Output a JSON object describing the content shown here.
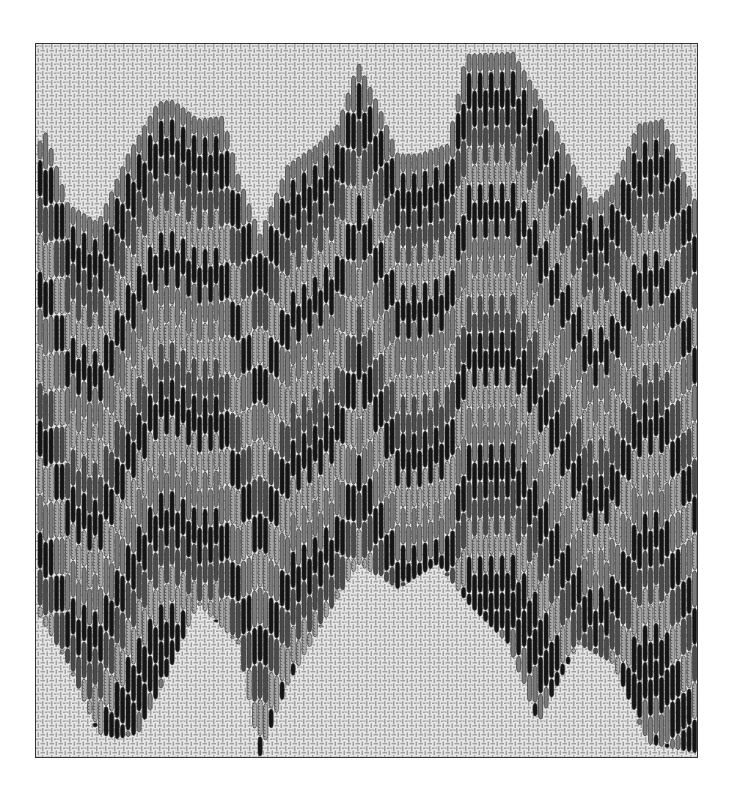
{
  "figure": {
    "frame": {
      "x": 35,
      "y": 43,
      "width": 663,
      "height": 715
    },
    "canvas": {
      "background": "#e6e6e6",
      "grid_color": "#9a9a9a",
      "grid_light": "#ffffff",
      "cell": 4.5
    },
    "stitch": {
      "column_width": 5.5,
      "step": 5.5,
      "outline": "#2a2a2a"
    },
    "colors": {
      "black": "#141414",
      "dark_gray": "#4a4a4a",
      "mid_gray": "#7a7a7a",
      "light_textured": "#a8a8a8"
    },
    "band_sequence": [
      "mid_gray",
      "black",
      "dark_gray",
      "light_textured",
      "black",
      "mid_gray",
      "light_textured",
      "dark_gray",
      "black",
      "light_textured",
      "mid_gray",
      "black",
      "dark_gray",
      "light_textured",
      "black",
      "black"
    ],
    "band_thickness": 36,
    "top_contour": [
      [
        0,
        100
      ],
      [
        8,
        88
      ],
      [
        30,
        160
      ],
      [
        60,
        178
      ],
      [
        90,
        110
      ],
      [
        120,
        58
      ],
      [
        135,
        56
      ],
      [
        160,
        75
      ],
      [
        185,
        72
      ],
      [
        200,
        130
      ],
      [
        222,
        190
      ],
      [
        250,
        120
      ],
      [
        280,
        100
      ],
      [
        300,
        80
      ],
      [
        320,
        18
      ],
      [
        340,
        60
      ],
      [
        360,
        110
      ],
      [
        380,
        110
      ],
      [
        410,
        100
      ],
      [
        428,
        10
      ],
      [
        475,
        8
      ],
      [
        500,
        50
      ],
      [
        530,
        110
      ],
      [
        555,
        160
      ],
      [
        575,
        140
      ],
      [
        600,
        80
      ],
      [
        625,
        75
      ],
      [
        650,
        140
      ],
      [
        663,
        170
      ]
    ],
    "bottom_contour": [
      [
        0,
        570
      ],
      [
        30,
        620
      ],
      [
        60,
        690
      ],
      [
        80,
        695
      ],
      [
        100,
        690
      ],
      [
        130,
        630
      ],
      [
        160,
        560
      ],
      [
        200,
        600
      ],
      [
        222,
        712
      ],
      [
        250,
        640
      ],
      [
        290,
        570
      ],
      [
        320,
        520
      ],
      [
        360,
        545
      ],
      [
        400,
        520
      ],
      [
        430,
        560
      ],
      [
        470,
        600
      ],
      [
        500,
        680
      ],
      [
        540,
        600
      ],
      [
        575,
        620
      ],
      [
        610,
        700
      ],
      [
        663,
        710
      ]
    ]
  }
}
